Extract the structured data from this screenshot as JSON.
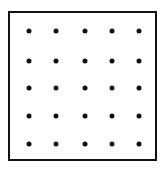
{
  "diagram": {
    "type": "dot-grid",
    "rows": 5,
    "cols": 5,
    "frame": {
      "left": 8,
      "top": 11,
      "width": 149,
      "height": 150,
      "border_color": "#111111"
    },
    "dot_color": "#111111",
    "col_x": [
      29,
      56,
      85,
      112,
      139
    ],
    "row_y": [
      31,
      61,
      88,
      116,
      144
    ]
  }
}
